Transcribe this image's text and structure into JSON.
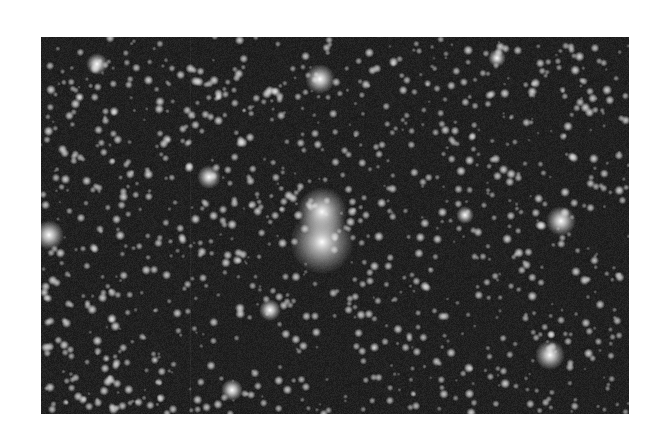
{
  "image": {
    "description": "Grayscale telescope image of a dense star field with two bright stars near the center",
    "frame": {
      "x": 41,
      "y": 37,
      "width": 588,
      "height": 377
    },
    "page_background": "#ffffff",
    "sky_color": "#1c1c1c",
    "star_color": "#ffffff",
    "bright_stars": [
      {
        "x": 322,
        "y": 212,
        "r": 7,
        "glow": 18
      },
      {
        "x": 322,
        "y": 242,
        "r": 8,
        "glow": 24
      },
      {
        "x": 49,
        "y": 235,
        "r": 5,
        "glow": 10
      },
      {
        "x": 320,
        "y": 79,
        "r": 5,
        "glow": 10
      },
      {
        "x": 561,
        "y": 221,
        "r": 5,
        "glow": 10
      },
      {
        "x": 550,
        "y": 355,
        "r": 5,
        "glow": 10
      },
      {
        "x": 209,
        "y": 177,
        "r": 4,
        "glow": 8
      },
      {
        "x": 97,
        "y": 64,
        "r": 4,
        "glow": 7
      },
      {
        "x": 270,
        "y": 310,
        "r": 4,
        "glow": 7
      },
      {
        "x": 497,
        "y": 58,
        "r": 3,
        "glow": 6
      },
      {
        "x": 232,
        "y": 390,
        "r": 4,
        "glow": 7
      },
      {
        "x": 465,
        "y": 215,
        "r": 3,
        "glow": 6
      }
    ],
    "faint_star_count": 1100,
    "seed": 1337
  }
}
